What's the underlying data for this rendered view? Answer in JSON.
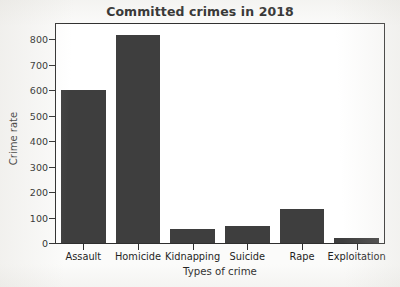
{
  "chart_data": {
    "type": "bar",
    "title": "Committed crimes in 2018",
    "xlabel": "Types of crime",
    "ylabel": "Crime rate",
    "categories": [
      "Assault",
      "Homicide",
      "Kidnapping",
      "Suicide",
      "Rape",
      "Exploitation"
    ],
    "values": [
      600,
      815,
      57,
      65,
      135,
      20
    ],
    "ylim": [
      0,
      860
    ],
    "yticks": [
      0,
      100,
      200,
      300,
      400,
      500,
      600,
      700,
      800
    ],
    "ytick_labels": [
      "0",
      "100",
      "200",
      "300",
      "400",
      "500",
      "600",
      "700",
      "800"
    ],
    "grid": false,
    "legend": null,
    "bar_color": "#3e3e3e",
    "axes_color": "#2e2e2e",
    "plot_background": "#ffffff",
    "figure_background": "#fbfbfa"
  }
}
